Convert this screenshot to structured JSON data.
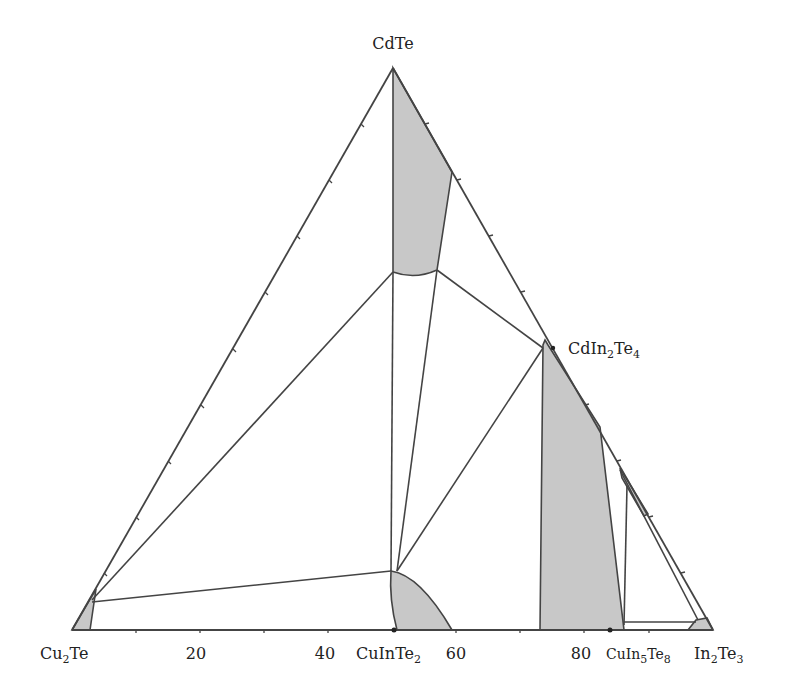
{
  "diagram": {
    "type": "ternary-phase-diagram",
    "vertices": {
      "top": {
        "name": "CdTe",
        "base": "CdTe",
        "sub": ""
      },
      "bottom_left": {
        "base": "Cu",
        "sub": "2",
        "rest": "Te"
      },
      "bottom_right": {
        "base": "In",
        "sub": "2",
        "rest": "Te",
        "sub2": "3"
      }
    },
    "compounds": {
      "cdin2te4": {
        "base": "CdIn",
        "sub": "2",
        "rest": "Te",
        "sub2": "4"
      },
      "cuinte2": {
        "base": "CuInTe",
        "sub": "2"
      },
      "cuin5te8": {
        "base": "CuIn",
        "sub": "5",
        "rest": "Te",
        "sub2": "8"
      }
    },
    "axis_ticks": [
      "20",
      "40",
      "60",
      "80"
    ],
    "colors": {
      "line": "#444444",
      "fill": "#c8c8c8",
      "text": "#222222"
    }
  }
}
